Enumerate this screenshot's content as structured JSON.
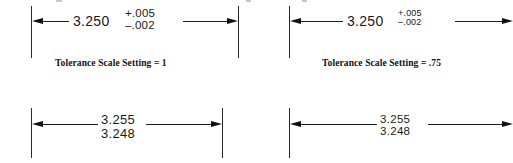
{
  "drawing": {
    "title": "Dimension Tolerance Scale Setting Comparison",
    "background_color": "#ffffff",
    "line_color": "#1d1d1d",
    "text_color": "#1a1a1a"
  },
  "figures": [
    {
      "id": "top-left",
      "kind": "plus-minus-tolerance",
      "nominal": "3.250",
      "tolerance_upper": "+.005",
      "tolerance_lower": "–.002",
      "caption": "Tolerance Scale Setting = 1",
      "tolerance_scale": "1",
      "left_arrow": "arrow-left",
      "right_arrow": "arrow-right"
    },
    {
      "id": "top-right",
      "kind": "plus-minus-tolerance",
      "nominal": "3.250",
      "tolerance_upper": "+.005",
      "tolerance_lower": "–.002",
      "caption": "Tolerance Scale Setting = .75",
      "tolerance_scale": ".75",
      "left_arrow": "arrow-left",
      "right_arrow": "arrow-right"
    },
    {
      "id": "bottom-left",
      "kind": "limit-dimension",
      "limit_upper": "3.255",
      "limit_lower": "3.248",
      "caption": "",
      "left_arrow": "arrow-left",
      "right_arrow": "arrow-right"
    },
    {
      "id": "bottom-right",
      "kind": "limit-dimension",
      "limit_upper": "3.255",
      "limit_lower": "3.248",
      "caption": "",
      "left_arrow": "arrow-left",
      "right_arrow": "arrow-right"
    }
  ]
}
